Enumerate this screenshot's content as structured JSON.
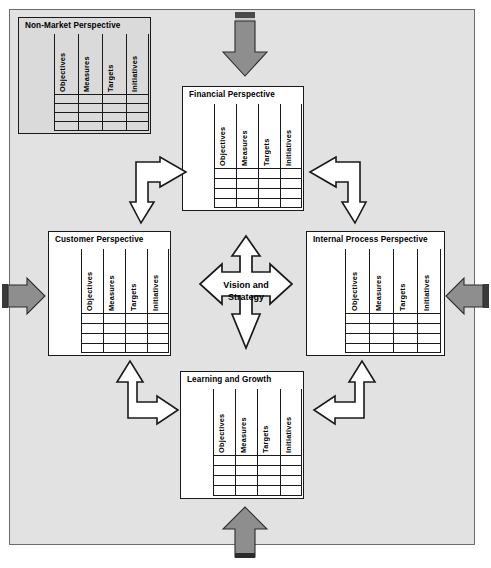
{
  "diagram": {
    "background_color": "#e2e2e2",
    "frame_border_color": "#6b6b6b",
    "card_fill": "#ffffff",
    "shaded_card_fill": "#dadada",
    "arrow_gray": "#8e8e8e",
    "line_color": "#1a1a1a"
  },
  "column_headers": [
    "Objectives",
    "Measures",
    "Targets",
    "Initiatives"
  ],
  "perspectives": [
    {
      "id": "non-market",
      "title": "Non-Market Perspective",
      "shaded": true,
      "columns": [
        "Objectives",
        "Measures",
        "Targets",
        "Initiatives"
      ],
      "row_count": 4
    },
    {
      "id": "financial",
      "title": "Financial Perspective",
      "shaded": false,
      "columns": [
        "Objectives",
        "Measures",
        "Targets",
        "Initiatives"
      ],
      "row_count": 4
    },
    {
      "id": "customer",
      "title": "Customer Perspective",
      "shaded": false,
      "columns": [
        "Objectives",
        "Measures",
        "Targets",
        "Initiatives"
      ],
      "row_count": 4
    },
    {
      "id": "internal-process",
      "title": "Internal Process Perspective",
      "shaded": false,
      "columns": [
        "Objectives",
        "Measures",
        "Targets",
        "Initiatives"
      ],
      "row_count": 4
    },
    {
      "id": "learning-growth",
      "title": "Learning and Growth",
      "shaded": false,
      "columns": [
        "Objectives",
        "Measures",
        "Targets",
        "Initiatives"
      ],
      "row_count": 4
    }
  ],
  "center": {
    "line1": "Vision and",
    "line2": "Strategy",
    "shape": "four-way-arrow"
  },
  "connectors": {
    "elbow_top_left": "double-headed-elbow-arrow-right-down",
    "elbow_top_right": "double-headed-elbow-arrow-left-down",
    "elbow_bottom_left": "double-headed-elbow-arrow-up-right",
    "elbow_bottom_right": "double-headed-elbow-arrow-up-left"
  },
  "external_arrows": {
    "top": "gray-arrow-down",
    "bottom": "gray-arrow-up",
    "left": "gray-arrow-right",
    "right": "gray-arrow-left"
  }
}
